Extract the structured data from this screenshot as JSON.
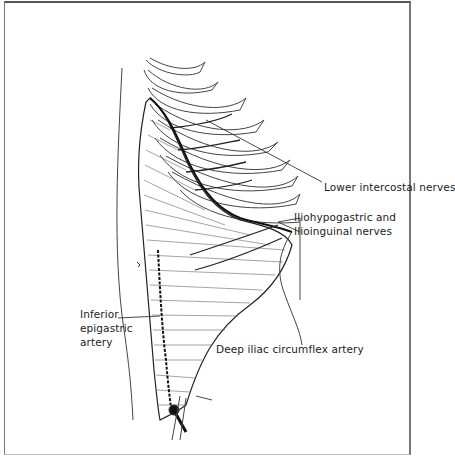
{
  "figure": {
    "type": "anatomical-illustration",
    "labels": {
      "lower_intercostal": "Lower intercostal nerves",
      "iliohypogastric_line1": "Iliohypogastric and",
      "iliohypogastric_line2": "Ilioinguinal nerves",
      "inferior_epigastric_line1": "Inferior",
      "inferior_epigastric_line2": "epigastric",
      "inferior_epigastric_line3": "artery",
      "deep_iliac": "Deep iliac circumflex artery"
    },
    "colors": {
      "ink": "#222222",
      "background": "#ffffff"
    }
  }
}
